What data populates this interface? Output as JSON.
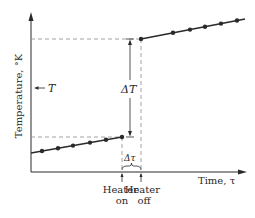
{
  "diagram": {
    "type": "temperature-vs-time",
    "y_axis_label": "Temperature, °K",
    "x_axis_label": "Time, τ",
    "t_marker_label": "T",
    "delta_T_label": "ΔT",
    "delta_tau_label": "Δτ",
    "heater_on_label_line1": "Heater",
    "heater_on_label_line2": "on",
    "heater_off_label_line1": "Heater",
    "heater_off_label_line2": "off",
    "colors": {
      "line": "#2a2a2a",
      "dashed": "#8a8a8a",
      "background": "#ffffff"
    },
    "lower_segment_points": [
      [
        31,
        153
      ],
      [
        42,
        148
      ],
      [
        58,
        146
      ],
      [
        73,
        143
      ],
      [
        90,
        141
      ],
      [
        106,
        139
      ],
      [
        122,
        137
      ]
    ],
    "upper_segment_points": [
      [
        141,
        39
      ],
      [
        173,
        32
      ],
      [
        190,
        29
      ],
      [
        205,
        27
      ],
      [
        221,
        24
      ],
      [
        237,
        21
      ],
      [
        245,
        19
      ]
    ]
  }
}
